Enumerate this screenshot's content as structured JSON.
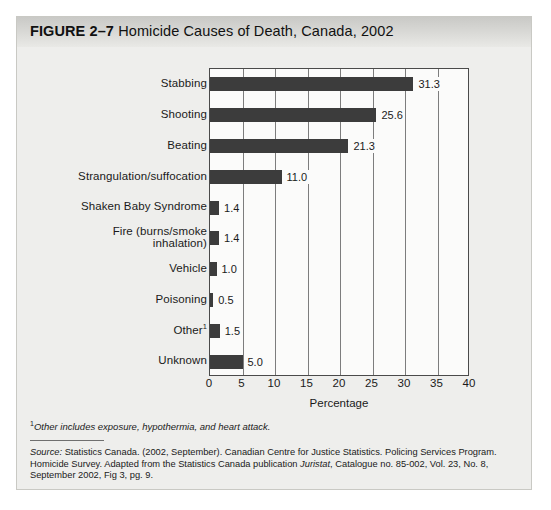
{
  "figure": {
    "number_label": "FIGURE 2–7",
    "title": "Homicide Causes of Death, Canada, 2002"
  },
  "chart_data": {
    "type": "bar",
    "orientation": "horizontal",
    "title": "Homicide Causes of Death, Canada, 2002",
    "xlabel": "Percentage",
    "ylabel": "",
    "xlim": [
      0,
      40
    ],
    "xticks": [
      0,
      5,
      10,
      15,
      20,
      25,
      30,
      35,
      40
    ],
    "xtick_labels": [
      "0",
      "5",
      "10",
      "15",
      "20",
      "25",
      "30",
      "35",
      "40"
    ],
    "grid": true,
    "legend": "none",
    "bar_color": "#3c3c3c",
    "categories": [
      "Stabbing",
      "Shooting",
      "Beating",
      "Strangulation/suffocation",
      "Shaken Baby Syndrome",
      "Fire (burns/smoke inhalation)",
      "Vehicle",
      "Poisoning",
      "Other",
      "Unknown"
    ],
    "category_labels_display": [
      "Stabbing",
      "Shooting",
      "Beating",
      "Strangulation/suffocation",
      "Shaken Baby Syndrome",
      "Fire (burns/smoke\ninhalation)",
      "Vehicle",
      "Poisoning",
      "Other¹",
      "Unknown"
    ],
    "values": [
      31.3,
      25.6,
      21.3,
      11.0,
      1.4,
      1.4,
      1.0,
      0.5,
      1.5,
      5.0
    ],
    "value_labels": [
      "31.3",
      "25.6",
      "21.3",
      "11.0",
      "1.4",
      "1.4",
      "1.0",
      "0.5",
      "1.5",
      "5.0"
    ]
  },
  "footnote": {
    "marker": "1",
    "text": "Other includes exposure, hypothermia, and heart attack."
  },
  "source": {
    "label": "Source:",
    "text_before_italic": " Statistics Canada. (2002, September). Canadian Centre for Justice Statistics. Policing Services Program. Homicide Survey. Adapted from the Statistics Canada publication ",
    "italic_title": "Juristat",
    "text_after_italic": ", Catalogue no. 85-002, Vol. 23, No. 8, September 2002, Fig 3, pg. 9."
  }
}
